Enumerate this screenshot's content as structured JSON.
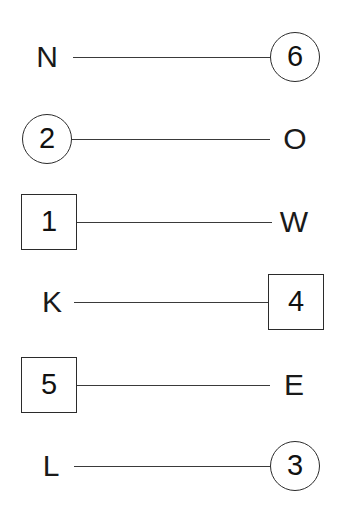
{
  "diagram": {
    "background_color": "#ffffff",
    "line_color": "#3a3a3a",
    "shape_border_color": "#2b2b2b",
    "text_color": "#111111",
    "rows": [
      {
        "left": {
          "text": "N",
          "shape": "none"
        },
        "right": {
          "text": "6",
          "shape": "circle"
        }
      },
      {
        "left": {
          "text": "2",
          "shape": "circle"
        },
        "right": {
          "text": "O",
          "shape": "none"
        }
      },
      {
        "left": {
          "text": "1",
          "shape": "square"
        },
        "right": {
          "text": "W",
          "shape": "none"
        }
      },
      {
        "left": {
          "text": "K",
          "shape": "none"
        },
        "right": {
          "text": "4",
          "shape": "square"
        }
      },
      {
        "left": {
          "text": "5",
          "shape": "square"
        },
        "right": {
          "text": "E",
          "shape": "none"
        }
      },
      {
        "left": {
          "text": "L",
          "shape": "none"
        },
        "right": {
          "text": "3",
          "shape": "circle"
        }
      }
    ]
  }
}
